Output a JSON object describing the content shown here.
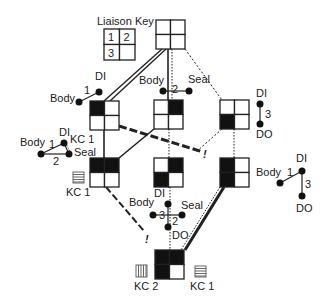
{
  "diagram": {
    "key": {
      "title": "Liaison Key",
      "cells": [
        "1",
        "2",
        "3",
        ""
      ]
    },
    "nodes": [
      {
        "id": "top",
        "x": 156,
        "y": 20,
        "filled": [
          false,
          false,
          false,
          false
        ]
      },
      {
        "id": "upper-left",
        "x": 90,
        "y": 101,
        "filled": [
          true,
          false,
          false,
          false
        ]
      },
      {
        "id": "upper-center",
        "x": 154,
        "y": 100,
        "filled": [
          false,
          true,
          false,
          false
        ]
      },
      {
        "id": "upper-right",
        "x": 220,
        "y": 100,
        "filled": [
          false,
          false,
          true,
          false
        ]
      },
      {
        "id": "lower-left",
        "x": 90,
        "y": 158,
        "filled": [
          true,
          true,
          false,
          false
        ]
      },
      {
        "id": "lower-center",
        "x": 154,
        "y": 158,
        "filled": [
          false,
          true,
          true,
          false
        ]
      },
      {
        "id": "lower-right",
        "x": 220,
        "y": 158,
        "filled": [
          true,
          false,
          true,
          false
        ]
      },
      {
        "id": "bottom",
        "x": 155,
        "y": 250,
        "filled": [
          true,
          true,
          true,
          false
        ]
      }
    ],
    "liaison_graphs": {
      "upper_left": {
        "labels": {
          "body": "Body",
          "di": "DI",
          "edge1": "1"
        }
      },
      "upper_center": {
        "labels": {
          "body": "Body",
          "seal": "Seal",
          "edge2": "2"
        }
      },
      "upper_right": {
        "labels": {
          "di": "DI",
          "do": "DO",
          "edge3": "3"
        }
      },
      "lower_left": {
        "labels": {
          "body": "Body",
          "di": "DI",
          "kc": "KC 1",
          "seal": "Seal",
          "edge1": "1",
          "edge2": "2"
        }
      },
      "lower_center": {
        "labels": {
          "di": "DI",
          "body": "Body",
          "seal": "Seal",
          "do": "DO",
          "edge3": "3",
          "edge2": "2"
        }
      },
      "lower_right": {
        "labels": {
          "di": "DI",
          "body": "Body",
          "do": "DO",
          "edge1": "1",
          "edge3": "3"
        }
      }
    },
    "key_characteristics": [
      {
        "id": "kc1-left",
        "label": "KC 1",
        "pattern": "horizontal"
      },
      {
        "id": "kc2-bottom",
        "label": "KC 2",
        "pattern": "vertical"
      },
      {
        "id": "kc1-bottom",
        "label": "KC 1",
        "pattern": "horizontal"
      }
    ],
    "markers": {
      "infeasible": "!"
    },
    "colors": {
      "ink": "#222222",
      "fill": "#111111",
      "background": "#ffffff"
    }
  }
}
